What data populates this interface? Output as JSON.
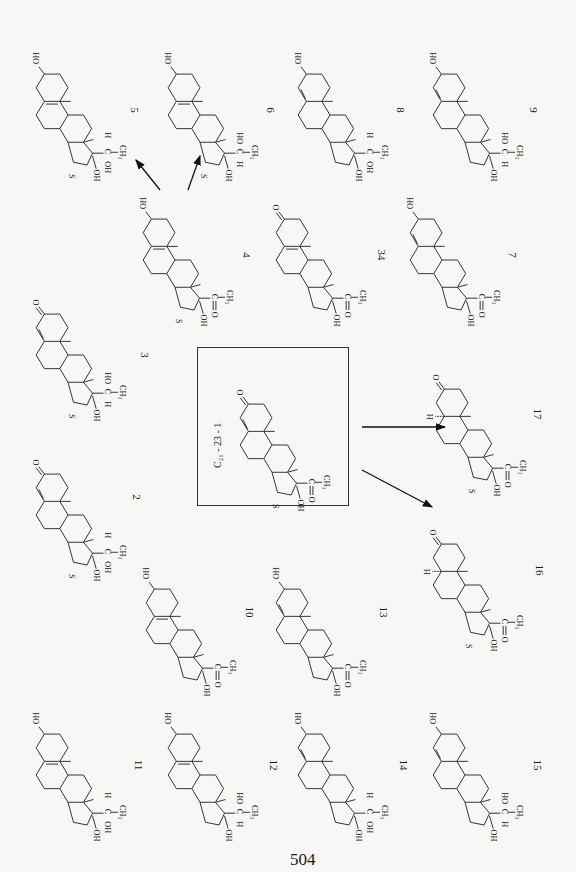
{
  "page": {
    "number": "504"
  },
  "parent": {
    "id": "C21-23-1",
    "formula_label": "C₂₁ - 23 - 1",
    "s_mark": "S",
    "type": "ketone-3-en",
    "side": "acetyl"
  },
  "compounds": [
    {
      "id": "5",
      "side": "H-C-OH",
      "ring_a": "HO",
      "double": "5-6",
      "s": "S"
    },
    {
      "id": "6",
      "side": "HO-C-H",
      "ring_a": "HO",
      "double": "5-6",
      "s": "S"
    },
    {
      "id": "8",
      "side": "H-C-OH",
      "ring_a": "HO",
      "double": "4-5",
      "s": ""
    },
    {
      "id": "9",
      "side": "HO-C-H",
      "ring_a": "HO",
      "double": "4-5",
      "s": ""
    },
    {
      "id": "4",
      "side": "C=O",
      "ring_a": "HO",
      "double": "5-6",
      "s": "S"
    },
    {
      "id": "34",
      "side": "C=O",
      "ring_a": "O",
      "double": "5-6",
      "s": ""
    },
    {
      "id": "7",
      "side": "C=O",
      "ring_a": "HO",
      "double": "4-5",
      "s": ""
    },
    {
      "id": "3",
      "side": "HO-C-H",
      "ring_a": "O",
      "double": "4-5",
      "s": "S"
    },
    {
      "id": "2",
      "side": "H-C-OH",
      "ring_a": "O",
      "double": "4-5",
      "s": "S"
    },
    {
      "id": "17",
      "side": "C=O",
      "ring_a": "O",
      "double": "none",
      "h5": "H",
      "s": "S"
    },
    {
      "id": "16",
      "side": "C=O",
      "ring_a": "O",
      "double": "none",
      "h5": "H",
      "s": "S"
    },
    {
      "id": "10",
      "side": "C=O",
      "ring_a": "HO",
      "double": "5-6",
      "s": ""
    },
    {
      "id": "13",
      "side": "C=O",
      "ring_a": "HO",
      "double": "4-5",
      "s": ""
    },
    {
      "id": "11",
      "side": "H-C-OH",
      "ring_a": "HO",
      "double": "5-6",
      "s": ""
    },
    {
      "id": "12",
      "side": "HO-C-H",
      "ring_a": "HO",
      "double": "5-6",
      "s": ""
    },
    {
      "id": "14",
      "side": "H-C-OH",
      "ring_a": "HO",
      "double": "4-5",
      "s": ""
    },
    {
      "id": "15",
      "side": "HO-C-H",
      "ring_a": "HO",
      "double": "4-5",
      "s": ""
    }
  ],
  "labels": {
    "ch3": "CH₃",
    "oh": "OH",
    "ho": "HO",
    "c": "C",
    "h": "H",
    "o": "O"
  }
}
